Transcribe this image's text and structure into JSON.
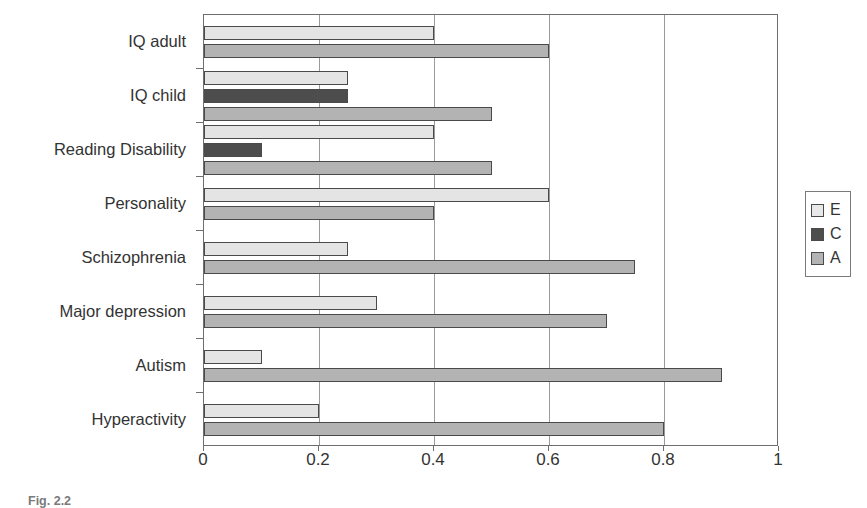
{
  "chart_data": {
    "type": "bar",
    "orientation": "horizontal",
    "title": "",
    "xlabel": "",
    "ylabel": "",
    "xlim": [
      0,
      1
    ],
    "xticks": [
      "0",
      "0.2",
      "0.4",
      "0.6",
      "0.8",
      "1"
    ],
    "xtick_values": [
      0,
      0.2,
      0.4,
      0.6,
      0.8,
      1
    ],
    "grid": "vertical",
    "legend_position": "right",
    "categories": [
      "IQ adult",
      "IQ child",
      "Reading Disability",
      "Personality",
      "Schizophrenia",
      "Major depression",
      "Autism",
      "Hyperactivity"
    ],
    "series": [
      {
        "name": "E",
        "color": "#e4e4e4",
        "values": [
          0.4,
          0.25,
          0.4,
          0.6,
          0.25,
          0.3,
          0.1,
          0.2
        ]
      },
      {
        "name": "C",
        "color": "#4d4d4d",
        "values": [
          null,
          0.25,
          0.1,
          null,
          null,
          null,
          null,
          null
        ]
      },
      {
        "name": "A",
        "color": "#b3b3b3",
        "values": [
          0.6,
          0.5,
          0.5,
          0.4,
          0.75,
          0.7,
          0.9,
          0.8
        ]
      }
    ]
  },
  "legend": {
    "entries": [
      {
        "label": "E",
        "key": "e"
      },
      {
        "label": "C",
        "key": "c"
      },
      {
        "label": "A",
        "key": "a"
      }
    ]
  },
  "caption": {
    "label": "Fig. 2.2",
    "text": ""
  }
}
